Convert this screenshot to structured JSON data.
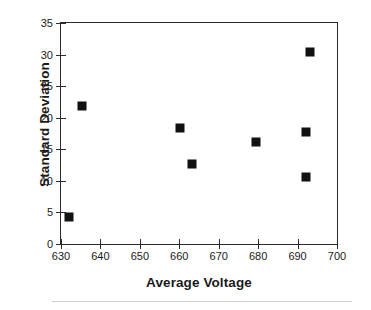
{
  "chart_data": {
    "type": "scatter",
    "title": "",
    "xlabel": "Average Voltage",
    "ylabel": "Standard Deviation",
    "xlim": [
      630,
      700
    ],
    "ylim": [
      0,
      35
    ],
    "xticks": [
      630,
      640,
      650,
      660,
      670,
      680,
      690,
      700
    ],
    "yticks": [
      0,
      5,
      10,
      15,
      20,
      25,
      30,
      35
    ],
    "grid": false,
    "legend": null,
    "marker_color": "#111111",
    "marker_shape": "square",
    "series": [
      {
        "name": "measurements",
        "points": [
          {
            "x": 632.0,
            "y": 4.2
          },
          {
            "x": 635.3,
            "y": 21.9
          },
          {
            "x": 660.1,
            "y": 18.3
          },
          {
            "x": 663.2,
            "y": 12.7
          },
          {
            "x": 679.5,
            "y": 16.2
          },
          {
            "x": 693.2,
            "y": 30.4
          },
          {
            "x": 692.2,
            "y": 17.7
          },
          {
            "x": 692.2,
            "y": 10.6
          }
        ]
      }
    ]
  },
  "axes": {
    "frame_color": "#2b2b2b",
    "background": "#ffffff"
  }
}
